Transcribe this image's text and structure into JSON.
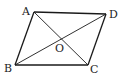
{
  "diagram": {
    "type": "geometry",
    "shape": "parallelogram",
    "name": "ABCD",
    "colors": {
      "stroke": "#1a1a1a",
      "label": "#222222",
      "background": "#ffffff"
    },
    "vertices": [
      {
        "id": "A",
        "label": "A",
        "x": 34,
        "y": 12,
        "label_x": 22,
        "label_y": 15
      },
      {
        "id": "D",
        "label": "D",
        "x": 106,
        "y": 14,
        "label_x": 109,
        "label_y": 18
      },
      {
        "id": "C",
        "label": "C",
        "x": 88,
        "y": 65,
        "label_x": 90,
        "label_y": 73
      },
      {
        "id": "B",
        "label": "B",
        "x": 15,
        "y": 65,
        "label_x": 4,
        "label_y": 72
      }
    ],
    "intersection": {
      "id": "O",
      "label": "O",
      "x": 61,
      "y": 39,
      "label_x": 55,
      "label_y": 52
    },
    "edges": [
      {
        "from": "A",
        "to": "D"
      },
      {
        "from": "D",
        "to": "C"
      },
      {
        "from": "C",
        "to": "B"
      },
      {
        "from": "B",
        "to": "A"
      }
    ],
    "diagonals": [
      {
        "from": "A",
        "to": "C"
      },
      {
        "from": "B",
        "to": "D"
      }
    ]
  }
}
